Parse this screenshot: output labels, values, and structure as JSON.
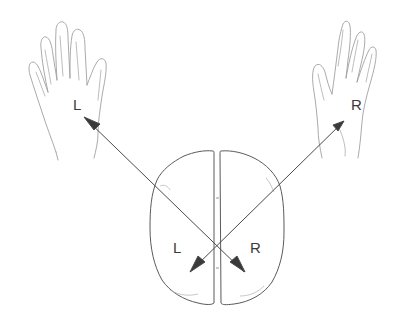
{
  "diagram": {
    "left_hand": {
      "label": "L"
    },
    "right_hand": {
      "label": "R"
    },
    "brain": {
      "left_hemisphere_label": "L",
      "right_hemisphere_label": "R"
    },
    "connections": [
      {
        "from": "brain-right-hemisphere",
        "to": "left-hand",
        "label": "R → L"
      },
      {
        "from": "brain-left-hemisphere",
        "to": "right-hand",
        "label": "L → R"
      }
    ],
    "colors": {
      "line": "#4a4a4a",
      "sketch": "#9a9a9a",
      "outline": "#5a5a5a",
      "text": "#3a3a3a"
    }
  }
}
